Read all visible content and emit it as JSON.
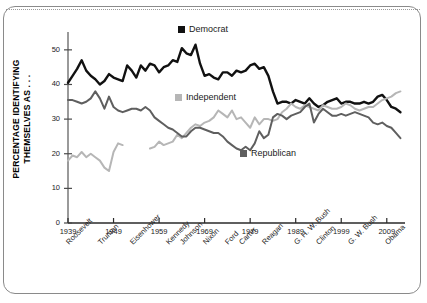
{
  "chart_data": {
    "type": "line",
    "title": "",
    "subtitle": "",
    "xlabel": "",
    "ylabel": "PERCENTAGE IDENTIFYING THEMSELVES AS . . .",
    "xlim": [
      1939,
      2013
    ],
    "ylim": [
      0,
      54
    ],
    "grid": false,
    "legend_position": "inside-plot",
    "y_ticks": [
      "0",
      "10",
      "20",
      "30",
      "40",
      "50"
    ],
    "y_tick_values": [
      0,
      10,
      20,
      30,
      40,
      50
    ],
    "x_ticks": [
      "1939",
      "1949",
      "1959",
      "1969",
      "1979",
      "1989",
      "1999",
      "2009"
    ],
    "x_tick_values": [
      1939,
      1949,
      1959,
      1969,
      1979,
      1989,
      1999,
      2009
    ],
    "presidents": [
      {
        "name": "Roosevelt",
        "year": 1939
      },
      {
        "name": "Truman",
        "year": 1946
      },
      {
        "name": "Eisenhower",
        "year": 1953
      },
      {
        "name": "Kennedy",
        "year": 1961
      },
      {
        "name": "Johnson",
        "year": 1964
      },
      {
        "name": "Nixon",
        "year": 1969
      },
      {
        "name": "Ford",
        "year": 1974
      },
      {
        "name": "Carter",
        "year": 1977
      },
      {
        "name": "Reagan",
        "year": 1982
      },
      {
        "name": "G. H. W. Bush",
        "year": 1989
      },
      {
        "name": "Clinton",
        "year": 1994
      },
      {
        "name": "G. W. Bush",
        "year": 2001
      },
      {
        "name": "Obama",
        "year": 2009
      }
    ],
    "series": [
      {
        "name": "Democrat",
        "color": "#111111",
        "x": [
          1939,
          1940,
          1941,
          1942,
          1943,
          1944,
          1945,
          1946,
          1947,
          1948,
          1949,
          1950,
          1951,
          1952,
          1953,
          1954,
          1955,
          1956,
          1957,
          1958,
          1959,
          1960,
          1961,
          1962,
          1963,
          1964,
          1965,
          1966,
          1967,
          1968,
          1969,
          1970,
          1971,
          1972,
          1973,
          1974,
          1975,
          1976,
          1977,
          1978,
          1979,
          1980,
          1981,
          1982,
          1983,
          1984,
          1985,
          1986,
          1987,
          1988,
          1989,
          1990,
          1991,
          1992,
          1993,
          1994,
          1995,
          1996,
          1997,
          1998,
          1999,
          2000,
          2001,
          2002,
          2003,
          2004,
          2005,
          2006,
          2007,
          2008,
          2009,
          2010,
          2011,
          2012
        ],
        "values": [
          40.5,
          42.5,
          44.5,
          47.0,
          44.0,
          42.5,
          41.5,
          40.0,
          41.0,
          43.0,
          42.0,
          41.5,
          41.0,
          45.5,
          44.0,
          42.0,
          45.5,
          44.0,
          46.0,
          45.5,
          43.5,
          45.0,
          45.5,
          47.0,
          46.5,
          50.5,
          49.0,
          48.5,
          51.5,
          46.0,
          42.5,
          43.0,
          42.0,
          41.5,
          43.5,
          43.5,
          42.5,
          44.0,
          43.5,
          44.0,
          45.5,
          46.0,
          44.5,
          45.0,
          42.5,
          38.0,
          34.5,
          35.0,
          35.0,
          34.5,
          35.5,
          35.0,
          34.5,
          36.0,
          34.5,
          33.5,
          34.0,
          35.0,
          35.5,
          36.0,
          34.5,
          35.0,
          35.0,
          34.5,
          34.5,
          35.0,
          34.5,
          35.0,
          36.5,
          37.0,
          35.5,
          33.5,
          33.0,
          32.0
        ]
      },
      {
        "name": "Independent",
        "color": "#b6b6b6",
        "x": [
          1939,
          1940,
          1941,
          1942,
          1943,
          1944,
          1945,
          1946,
          1947,
          1948,
          1949,
          1950,
          1951,
          1957,
          1958,
          1959,
          1960,
          1961,
          1962,
          1963,
          1964,
          1965,
          1966,
          1967,
          1968,
          1969,
          1970,
          1971,
          1972,
          1973,
          1974,
          1975,
          1976,
          1977,
          1978,
          1979,
          1980,
          1981,
          1982,
          1983,
          1984,
          1985,
          1986,
          1987,
          1988,
          1989,
          1990,
          1991,
          1992,
          1993,
          1994,
          1995,
          1996,
          1997,
          1998,
          1999,
          2000,
          2001,
          2002,
          2003,
          2004,
          2005,
          2006,
          2007,
          2008,
          2009,
          2010,
          2011,
          2012
        ],
        "values": [
          18.0,
          19.5,
          19.0,
          20.5,
          19.0,
          20.0,
          19.0,
          18.0,
          16.0,
          15.0,
          20.5,
          23.0,
          22.5,
          21.5,
          22.0,
          23.5,
          22.5,
          23.0,
          23.5,
          25.5,
          24.5,
          26.0,
          27.5,
          28.5,
          28.0,
          29.0,
          29.5,
          30.5,
          32.5,
          31.5,
          30.5,
          32.5,
          30.0,
          30.5,
          29.0,
          27.5,
          30.5,
          28.5,
          30.0,
          30.0,
          29.5,
          30.0,
          32.0,
          33.0,
          34.5,
          33.5,
          33.0,
          34.0,
          33.5,
          33.0,
          32.5,
          34.0,
          33.5,
          33.0,
          33.0,
          33.5,
          34.5,
          34.0,
          33.0,
          32.5,
          33.0,
          33.5,
          33.5,
          34.5,
          35.5,
          36.0,
          36.5,
          37.5,
          38.0
        ]
      },
      {
        "name": "Republican",
        "color": "#5f5f5f",
        "x": [
          1939,
          1940,
          1941,
          1942,
          1943,
          1944,
          1945,
          1946,
          1947,
          1948,
          1949,
          1950,
          1951,
          1952,
          1953,
          1954,
          1955,
          1956,
          1957,
          1958,
          1959,
          1960,
          1961,
          1962,
          1963,
          1964,
          1965,
          1966,
          1967,
          1968,
          1969,
          1970,
          1971,
          1972,
          1973,
          1974,
          1975,
          1976,
          1977,
          1978,
          1979,
          1980,
          1981,
          1982,
          1983,
          1984,
          1985,
          1986,
          1987,
          1988,
          1989,
          1990,
          1991,
          1992,
          1993,
          1994,
          1995,
          1996,
          1997,
          1998,
          1999,
          2000,
          2001,
          2002,
          2003,
          2004,
          2005,
          2006,
          2007,
          2008,
          2009,
          2010,
          2011,
          2012
        ],
        "values": [
          35.5,
          35.5,
          35.0,
          34.5,
          35.0,
          36.0,
          38.0,
          36.0,
          33.0,
          36.5,
          33.5,
          32.5,
          32.0,
          32.5,
          33.0,
          33.0,
          32.5,
          33.5,
          32.5,
          30.5,
          29.5,
          28.5,
          27.5,
          27.0,
          26.0,
          25.0,
          25.0,
          26.5,
          27.5,
          27.5,
          27.0,
          26.5,
          26.0,
          26.0,
          25.0,
          23.5,
          22.5,
          21.5,
          21.0,
          22.0,
          21.0,
          23.0,
          26.5,
          24.5,
          25.5,
          30.5,
          31.5,
          31.0,
          30.0,
          31.0,
          31.5,
          32.0,
          33.5,
          34.5,
          29.0,
          31.5,
          33.0,
          32.0,
          31.0,
          31.0,
          31.5,
          31.0,
          31.5,
          32.0,
          31.5,
          31.0,
          30.5,
          29.0,
          28.5,
          29.0,
          28.0,
          27.5,
          26.0,
          24.5
        ]
      }
    ]
  },
  "legend": {
    "items": [
      {
        "label": "Democrat",
        "color": "#111111"
      },
      {
        "label": "Independent",
        "color": "#b6b6b6"
      },
      {
        "label": "Republican",
        "color": "#5f5f5f"
      }
    ]
  }
}
